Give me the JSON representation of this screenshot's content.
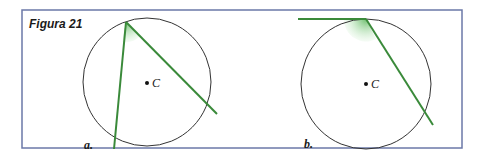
{
  "figure": {
    "title": "Figura 21",
    "frame_color": "#6b78a8",
    "line_color": "#3a8a3a",
    "shade_color": "#7cc47c",
    "panels": [
      {
        "label": "a.",
        "center_label": "C",
        "description": "Inscribed angle: two chords from a point on the circle"
      },
      {
        "label": "b.",
        "center_label": "C",
        "description": "Tangent-chord angle: tangent line and chord at a point on the circle"
      }
    ]
  }
}
